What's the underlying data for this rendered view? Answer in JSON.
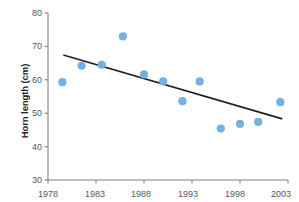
{
  "chart_data": {
    "type": "scatter",
    "title": "",
    "xlabel": "",
    "ylabel": "Horn length (cm)",
    "xlim": [
      1978,
      2003
    ],
    "ylim": [
      30,
      80
    ],
    "xticks": [
      1978,
      1983,
      1988,
      1993,
      1998,
      2003
    ],
    "yticks": [
      30,
      40,
      50,
      60,
      70,
      80
    ],
    "xtick_labels": [
      "1978",
      "1983",
      "1988",
      "1993",
      "1998",
      "2003"
    ],
    "ytick_labels": [
      "30",
      "40",
      "50",
      "60",
      "70",
      "80"
    ],
    "grid": false,
    "legend": "none",
    "series": [
      {
        "name": "Horn length",
        "marker": "circle",
        "color": "#74b0e0",
        "points": [
          {
            "x": 1979.5,
            "y": 59.3
          },
          {
            "x": 1981.5,
            "y": 64.2
          },
          {
            "x": 1983.6,
            "y": 64.5
          },
          {
            "x": 1985.8,
            "y": 73.0
          },
          {
            "x": 1988.0,
            "y": 61.6
          },
          {
            "x": 1990.0,
            "y": 59.5
          },
          {
            "x": 1992.0,
            "y": 53.6
          },
          {
            "x": 1993.8,
            "y": 59.5
          },
          {
            "x": 1996.0,
            "y": 45.4
          },
          {
            "x": 1998.0,
            "y": 46.8
          },
          {
            "x": 1999.9,
            "y": 47.4
          },
          {
            "x": 2002.2,
            "y": 53.3
          }
        ]
      }
    ],
    "trendline": {
      "name": "linear fit",
      "color": "#231f20",
      "x_start": 1979.6,
      "y_start": 67.4,
      "x_end": 2002.4,
      "y_end": 48.3
    },
    "axis_color": "#808285",
    "tick_label_color": "#58595b",
    "background": "#ffffff"
  }
}
